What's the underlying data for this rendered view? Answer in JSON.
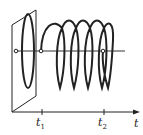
{
  "diagram": {
    "colors": {
      "line": "#222222",
      "background": "#ffffff"
    },
    "axis": {
      "label": "t"
    },
    "markers": [
      {
        "label": "t",
        "sub": "1"
      },
      {
        "label": "t",
        "sub": "2"
      }
    ]
  }
}
